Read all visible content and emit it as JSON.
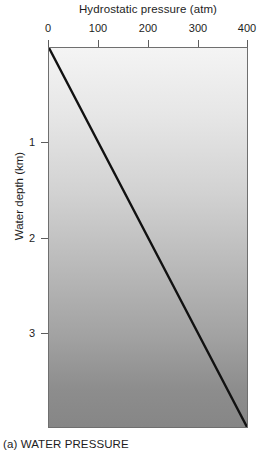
{
  "caption": "(a) WATER PRESSURE",
  "chart_data": {
    "type": "line",
    "title": "Hydrostatic pressure (atm)",
    "xlabel": "Hydrostatic pressure (atm)",
    "ylabel": "Water depth (km)",
    "xlim": [
      0,
      400
    ],
    "ylim": [
      0,
      4
    ],
    "y_inverted": true,
    "grid": false,
    "legend": null,
    "x_ticks": [
      0,
      100,
      200,
      300,
      400
    ],
    "x_tick_labels": [
      "0",
      "100",
      "200",
      "300",
      "400"
    ],
    "y_ticks": [
      1,
      2,
      3
    ],
    "y_tick_labels": [
      "1",
      "2",
      "3"
    ],
    "series": [
      {
        "name": "Hydrostatic pressure vs depth",
        "x": [
          0,
          100,
          200,
          300,
          400
        ],
        "y": [
          0,
          1,
          2,
          3,
          4
        ],
        "color": "#111111",
        "line_width": 2.4
      }
    ],
    "plot_fill": {
      "description": "vertical gradient, light at surface darkening with depth",
      "top_color": "#f4f4f4",
      "bottom_color": "#868686"
    },
    "frame_color": "#6f6f6f"
  }
}
